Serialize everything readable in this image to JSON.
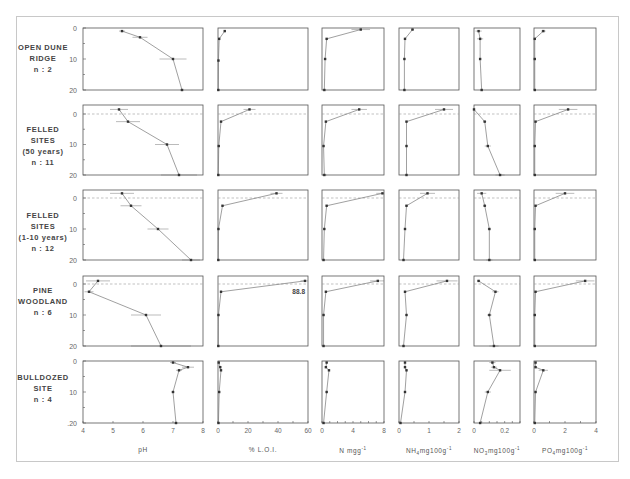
{
  "chart_data": {
    "type": "line",
    "title": "",
    "ylabel": "Depth (cm)",
    "yticks": [
      0,
      10,
      20
    ],
    "ylim": [
      20,
      0
    ],
    "depths": [
      -1,
      1.5,
      10,
      20
    ],
    "variables": [
      {
        "key": "pH",
        "xlabel": "pH",
        "xlim": [
          4,
          8
        ],
        "xticks": [
          4,
          5,
          6,
          7,
          8
        ]
      },
      {
        "key": "LOI",
        "xlabel": "% L.O.I.",
        "xlim": [
          0,
          60
        ],
        "xticks": [
          0,
          20,
          40,
          60
        ]
      },
      {
        "key": "N",
        "xlabel": "N mgg-1",
        "xlim": [
          0,
          8
        ],
        "xticks": [
          0,
          4,
          8
        ]
      },
      {
        "key": "NH4",
        "xlabel": "NH4 mg100g-1",
        "xlim": [
          0,
          2
        ],
        "xticks": [
          0,
          1,
          2
        ]
      },
      {
        "key": "NO3",
        "xlabel": "NO3 mg100g-1",
        "xlim": [
          0,
          0.3
        ],
        "xticks": [
          0,
          0.2
        ]
      },
      {
        "key": "PO4",
        "xlabel": "PO4 mg100g-1",
        "xlim": [
          0,
          4
        ],
        "xticks": [
          0,
          2,
          4
        ]
      }
    ],
    "sites": [
      {
        "name": "OPEN DUNE RIDGE",
        "n": 2,
        "dashed_surface": false,
        "series": {
          "pH": {
            "depth": [
              1,
              3,
              10,
              20
            ],
            "x": [
              5.3,
              5.9,
              7.0,
              7.3
            ],
            "err": [
              0.1,
              0.25,
              0.45,
              0.05
            ]
          },
          "LOI": {
            "depth": [
              1,
              3.5,
              10.5,
              20
            ],
            "x": [
              4.5,
              0.8,
              0.3,
              0.2
            ],
            "err": [
              0.6,
              0.2,
              0.1,
              0.05
            ]
          },
          "N": {
            "depth": [
              0.5,
              3.5,
              10,
              20
            ],
            "x": [
              5.0,
              0.6,
              0.4,
              0.3
            ],
            "err": [
              1.2,
              0.1,
              0.05,
              0.05
            ]
          },
          "NH4": {
            "depth": [
              0.5,
              3.5,
              10,
              20
            ],
            "x": [
              0.45,
              0.2,
              0.18,
              0.18
            ],
            "err": [
              0.05,
              0.02,
              0.02,
              0.02
            ]
          },
          "NO3": {
            "depth": [
              1,
              3.5,
              10,
              20
            ],
            "x": [
              0.03,
              0.04,
              0.04,
              0.05
            ],
            "err": [
              0.02,
              0.02,
              0.005,
              0.005
            ]
          },
          "PO4": {
            "depth": [
              1,
              3.5,
              10,
              20
            ],
            "x": [
              0.6,
              0.05,
              0.05,
              0.05
            ],
            "err": [
              0.15,
              0.02,
              0.02,
              0.02
            ]
          }
        }
      },
      {
        "name": "FELLED SITES (50 years)",
        "n": 11,
        "dashed_surface": true,
        "series": {
          "pH": {
            "depth": [
              -1.5,
              2.5,
              10,
              20
            ],
            "x": [
              5.2,
              5.5,
              6.8,
              7.2
            ],
            "err": [
              0.3,
              0.4,
              0.4,
              0.6
            ]
          },
          "LOI": {
            "depth": [
              -1.5,
              2.5,
              10.5,
              20
            ],
            "x": [
              21,
              2,
              0.5,
              0.2
            ],
            "err": [
              4,
              0.5,
              0.2,
              0.1
            ]
          },
          "N": {
            "depth": [
              -1.5,
              2.5,
              10.5,
              20
            ],
            "x": [
              4.8,
              0.5,
              0.2,
              0.3
            ],
            "err": [
              1.0,
              0.1,
              0.05,
              0.3
            ]
          },
          "NH4": {
            "depth": [
              -1.5,
              2.5,
              10.5,
              20
            ],
            "x": [
              1.5,
              0.25,
              0.25,
              0.25
            ],
            "err": [
              0.3,
              0.03,
              0.03,
              0.03
            ]
          },
          "NO3": {
            "depth": [
              -1.5,
              2.5,
              10.5,
              20
            ],
            "x": [
              0.0,
              0.07,
              0.09,
              0.17
            ],
            "err": [
              0.005,
              0.01,
              0.02,
              0.03
            ]
          },
          "PO4": {
            "depth": [
              -1.5,
              2.5,
              10.5,
              20
            ],
            "x": [
              2.2,
              0.1,
              0.05,
              0.05
            ],
            "err": [
              0.6,
              0.05,
              0.02,
              0.02
            ]
          }
        }
      },
      {
        "name": "FELLED SITES (1-10 years)",
        "n": 12,
        "dashed_surface": true,
        "series": {
          "pH": {
            "depth": [
              -1.5,
              2.5,
              10,
              20
            ],
            "x": [
              5.3,
              5.6,
              6.5,
              7.6
            ],
            "err": [
              0.4,
              0.35,
              0.35,
              0.3
            ]
          },
          "LOI": {
            "depth": [
              -1.5,
              2.5,
              10,
              20
            ],
            "x": [
              39,
              3,
              0.3,
              0.2
            ],
            "err": [
              4,
              0.5,
              0.1,
              0.1
            ]
          },
          "N": {
            "depth": [
              -1.5,
              2.5,
              10,
              20
            ],
            "x": [
              7.8,
              0.6,
              0.3,
              0.2
            ],
            "err": [
              0.8,
              0.1,
              0.05,
              0.1
            ]
          },
          "NH4": {
            "depth": [
              -1.5,
              2.5,
              10,
              20
            ],
            "x": [
              0.95,
              0.25,
              0.2,
              0.15
            ],
            "err": [
              0.25,
              0.05,
              0.03,
              0.03
            ]
          },
          "NO3": {
            "depth": [
              -1.5,
              2.5,
              10,
              20
            ],
            "x": [
              0.05,
              0.07,
              0.1,
              0.1
            ],
            "err": [
              0.03,
              0.01,
              0.01,
              0.02
            ]
          },
          "PO4": {
            "depth": [
              -1.5,
              2.5,
              10,
              20
            ],
            "x": [
              2.0,
              0.1,
              0.05,
              0.05
            ],
            "err": [
              0.6,
              0.05,
              0.02,
              0.02
            ]
          }
        }
      },
      {
        "name": "PINE WOODLAND",
        "n": 6,
        "dashed_surface": true,
        "series": {
          "pH": {
            "depth": [
              -1,
              2.5,
              10,
              20
            ],
            "x": [
              4.5,
              4.2,
              6.1,
              6.6
            ],
            "err": [
              0.4,
              0.15,
              0.5,
              1.0
            ]
          },
          "LOI": {
            "depth": [
              -1,
              2.5,
              10,
              20
            ],
            "x": [
              58,
              2,
              0.3,
              0.2
            ],
            "err": [
              3,
              0.5,
              0.1,
              0.1
            ],
            "annotation": "88.8"
          },
          "N": {
            "depth": [
              -1,
              2.5,
              10,
              20
            ],
            "x": [
              7.2,
              0.5,
              0.2,
              0.2
            ],
            "err": [
              1.0,
              0.1,
              0.05,
              0.05
            ]
          },
          "NH4": {
            "depth": [
              -1,
              2.5,
              10,
              20
            ],
            "x": [
              1.6,
              0.2,
              0.25,
              0.15
            ],
            "err": [
              0.35,
              0.03,
              0.03,
              0.03
            ]
          },
          "NO3": {
            "depth": [
              -1,
              2.5,
              10,
              20
            ],
            "x": [
              0.03,
              0.14,
              0.1,
              0.13
            ],
            "err": [
              0.01,
              0.02,
              0.015,
              0.03
            ]
          },
          "PO4": {
            "depth": [
              -1,
              2.5,
              10,
              20
            ],
            "x": [
              3.3,
              0.1,
              0.05,
              0.05
            ],
            "err": [
              0.6,
              0.05,
              0.02,
              0.02
            ]
          }
        }
      },
      {
        "name": "BULLDOZED SITE",
        "n": 4,
        "dashed_surface": false,
        "series": {
          "pH": {
            "depth": [
              0.5,
              2,
              3,
              10,
              20
            ],
            "x": [
              7.0,
              7.5,
              7.2,
              7.0,
              7.1
            ],
            "err": [
              0.1,
              0.2,
              0.1,
              0.05,
              0.05
            ]
          },
          "LOI": {
            "depth": [
              0.5,
              2,
              3,
              10,
              20
            ],
            "x": [
              0.5,
              1.5,
              2.0,
              0.8,
              0.3
            ],
            "err": [
              0.2,
              0.3,
              0.3,
              0.2,
              0.1
            ]
          },
          "N": {
            "depth": [
              0.5,
              2,
              3,
              10,
              20
            ],
            "x": [
              0.6,
              0.5,
              0.9,
              0.6,
              0.2
            ],
            "err": [
              0.1,
              0.1,
              0.1,
              0.1,
              0.05
            ]
          },
          "NH4": {
            "depth": [
              0.5,
              2,
              3,
              10,
              20
            ],
            "x": [
              0.2,
              0.2,
              0.25,
              0.2,
              0.05
            ],
            "err": [
              0.02,
              0.02,
              0.02,
              0.02,
              0.02
            ]
          },
          "NO3": {
            "depth": [
              0.5,
              2,
              3,
              10,
              20
            ],
            "x": [
              0.12,
              0.13,
              0.17,
              0.09,
              0.04
            ],
            "err": [
              0.02,
              0.02,
              0.07,
              0.02,
              0.005
            ]
          },
          "PO4": {
            "depth": [
              0.5,
              2,
              3,
              10,
              20
            ],
            "x": [
              0.1,
              0.1,
              0.6,
              0.1,
              0.05
            ],
            "err": [
              0.05,
              0.05,
              0.3,
              0.05,
              0.02
            ]
          }
        }
      }
    ]
  },
  "labels": {
    "sites": [
      {
        "lines": [
          "OPEN DUNE",
          "RIDGE",
          "n : 2"
        ]
      },
      {
        "lines": [
          "FELLED",
          "SITES",
          "(50 years)",
          "n : 11"
        ]
      },
      {
        "lines": [
          "FELLED",
          "SITES",
          "(1-10 years)",
          "n : 12"
        ]
      },
      {
        "lines": [
          "PINE",
          "WOODLAND",
          "n : 6"
        ]
      },
      {
        "lines": [
          "BULLDOZED",
          "SITE",
          "n : 4"
        ]
      }
    ],
    "xaxis": [
      {
        "main": "pH",
        "sub": "",
        "rest": ""
      },
      {
        "main": "% L.O.I.",
        "sub": "",
        "rest": ""
      },
      {
        "main": "N mgg",
        "sub": "",
        "rest": "",
        "sup": "-1"
      },
      {
        "main": "NH",
        "sub": "4",
        "rest": "mg100g",
        "sup": "-1"
      },
      {
        "main": "NO",
        "sub": "3",
        "rest": "mg100g",
        "sup": "-1"
      },
      {
        "main": "PO",
        "sub": "4",
        "rest": "mg100g",
        "sup": "-1"
      }
    ],
    "ytick_labels": [
      "0",
      "10",
      "20"
    ]
  },
  "colors": {
    "axis": "#555555",
    "line": "#777777",
    "marker": "#333333",
    "dashed": "#999999",
    "tick_text": "#666666"
  }
}
